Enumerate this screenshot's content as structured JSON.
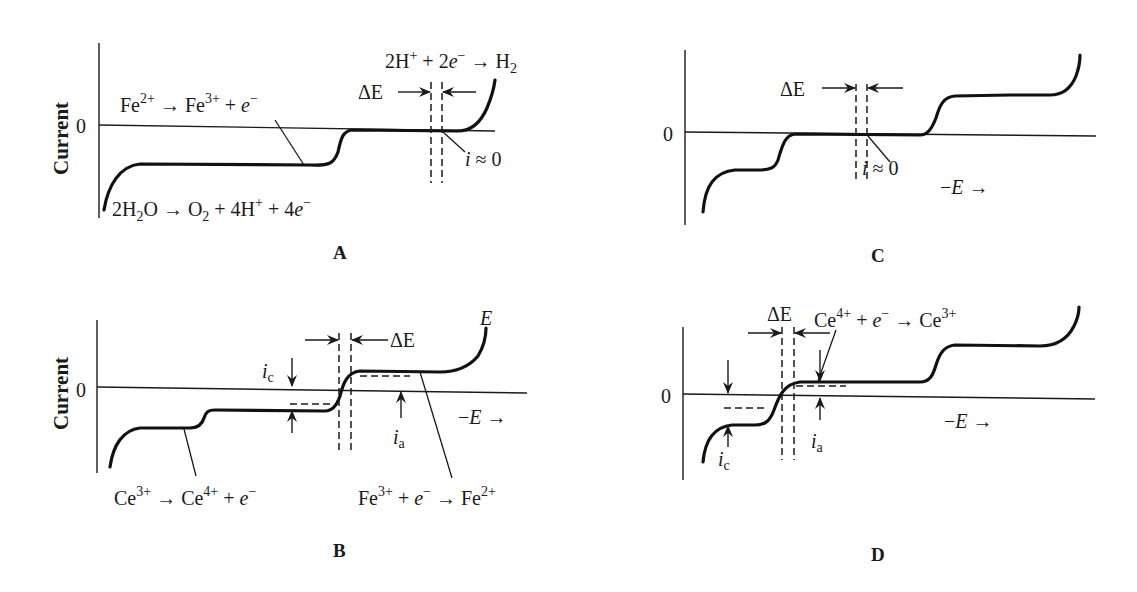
{
  "figure": {
    "panels": {
      "A": {
        "label": "A",
        "ylabel": "Current",
        "zero_tick": "0",
        "delta_e": "ΔE",
        "i_zero": {
          "i": "i",
          "approx": " ≈ 0"
        },
        "reaction_top_right": {
          "a": "2H",
          "a_sup": "+",
          "b": " + 2",
          "e": "e",
          "e_sup": "−",
          "c": " → H",
          "c_sub": "2"
        },
        "reaction_fe": {
          "a": "Fe",
          "a_sup": "2+",
          "b": " → Fe",
          "b_sup": "3+",
          "c": " + ",
          "e": "e",
          "e_sup": "−"
        },
        "reaction_water": {
          "a": "2H",
          "a_sub": "2",
          "b": "O → O",
          "b_sub": "2",
          "c": " + 4H",
          "c_sup": "+",
          "d": " + 4",
          "e": "e",
          "e_sup": "−"
        }
      },
      "B": {
        "label": "B",
        "ylabel": "Current",
        "zero_tick": "0",
        "delta_e": "ΔE",
        "e_label": "E",
        "neg_e_axis": {
          "minus": "−",
          "e": "E",
          "arrow": " →"
        },
        "ic": {
          "i": "i",
          "sub": "c"
        },
        "ia": {
          "i": "i",
          "sub": "a"
        },
        "reaction_ce": {
          "a": "Ce",
          "a_sup": "3+",
          "b": " → Ce",
          "b_sup": "4+",
          "c": " + ",
          "e": "e",
          "e_sup": "−"
        },
        "reaction_fe": {
          "a": "Fe",
          "a_sup": "3+",
          "b": " + ",
          "e": "e",
          "e_sup": "−",
          "c": " → Fe",
          "c_sup": "2+"
        }
      },
      "C": {
        "label": "C",
        "zero_tick": "0",
        "delta_e": "ΔE",
        "i_zero": {
          "i": "i",
          "approx": " ≈ 0"
        },
        "neg_e_axis": {
          "minus": "−",
          "e": "E",
          "arrow": " →"
        }
      },
      "D": {
        "label": "D",
        "zero_tick": "0",
        "delta_e": "ΔE",
        "neg_e_axis": {
          "minus": "−",
          "e": "E",
          "arrow": " →"
        },
        "ic": {
          "i": "i",
          "sub": "c"
        },
        "ia": {
          "i": "i",
          "sub": "a"
        },
        "reaction_ce": {
          "a": "Ce",
          "a_sup": "4+",
          "b": " + ",
          "e": "e",
          "e_sup": "−",
          "c": " → Ce",
          "c_sup": "3+"
        }
      }
    }
  }
}
